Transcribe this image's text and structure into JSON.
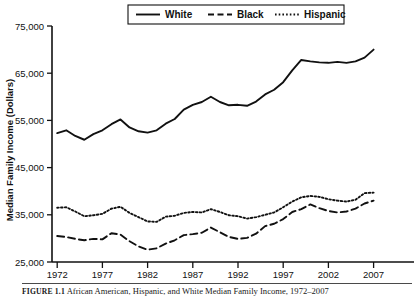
{
  "figure": {
    "caption_label": "FIGURE 1.1",
    "caption_text": "African American, Hispanic, and White Median Family Income, 1972–2007"
  },
  "legend": {
    "position": "top-center",
    "items": [
      {
        "label": "White",
        "style": "solid"
      },
      {
        "label": "Black",
        "style": "dashed"
      },
      {
        "label": "Hispanic",
        "style": "dotted"
      }
    ]
  },
  "axes": {
    "ylabel": "Median Family Income (Dollars)",
    "xlabel": "",
    "ytick_labels": [
      "75,000",
      "65,000",
      "55,000",
      "45,000",
      "35,000",
      "25,000"
    ],
    "xtick_labels": [
      "1972",
      "1977",
      "1982",
      "1987",
      "1992",
      "1997",
      "2002",
      "2007"
    ]
  },
  "chart_data": {
    "type": "line",
    "title": "",
    "subtitle": "",
    "xlabel": "",
    "ylabel": "Median Family Income (Dollars)",
    "xlim": [
      1972,
      2007
    ],
    "ylim": [
      25000,
      75000
    ],
    "yticks": [
      25000,
      35000,
      45000,
      55000,
      65000,
      75000
    ],
    "xticks": [
      1972,
      1977,
      1982,
      1987,
      1992,
      1997,
      2002,
      2007
    ],
    "grid": false,
    "legend_position": "top-center",
    "x": [
      1972,
      1973,
      1974,
      1975,
      1976,
      1977,
      1978,
      1979,
      1980,
      1981,
      1982,
      1983,
      1984,
      1985,
      1986,
      1987,
      1988,
      1989,
      1990,
      1991,
      1992,
      1993,
      1994,
      1995,
      1996,
      1997,
      1998,
      1999,
      2000,
      2001,
      2002,
      2003,
      2004,
      2005,
      2006,
      2007
    ],
    "series": [
      {
        "name": "White",
        "style": "solid",
        "values": [
          52300,
          52900,
          51700,
          50900,
          52100,
          52900,
          54200,
          55200,
          53500,
          52700,
          52400,
          52900,
          54300,
          55300,
          57300,
          58300,
          58900,
          60000,
          58900,
          58200,
          58300,
          58100,
          59000,
          60500,
          61500,
          63100,
          65600,
          67800,
          67500,
          67300,
          67200,
          67400,
          67200,
          67500,
          68300,
          70000
        ]
      },
      {
        "name": "Black",
        "style": "dashed",
        "values": [
          30500,
          30300,
          29900,
          29600,
          29900,
          29800,
          31100,
          30800,
          29400,
          28300,
          27600,
          27900,
          28900,
          29600,
          30700,
          30900,
          31200,
          32300,
          31300,
          30300,
          29900,
          30100,
          31000,
          32600,
          33100,
          34100,
          35600,
          36200,
          37200,
          36400,
          35800,
          35500,
          35700,
          36300,
          37400,
          38000
        ]
      },
      {
        "name": "Hispanic",
        "style": "dotted",
        "values": [
          36500,
          36600,
          35700,
          34700,
          34900,
          35200,
          36300,
          36700,
          35400,
          34500,
          33600,
          33500,
          34600,
          34800,
          35400,
          35600,
          35500,
          36200,
          35600,
          34900,
          34700,
          34200,
          34500,
          35000,
          35500,
          36600,
          37800,
          38700,
          39000,
          38800,
          38300,
          38000,
          37800,
          38200,
          39600,
          39700
        ]
      }
    ]
  }
}
